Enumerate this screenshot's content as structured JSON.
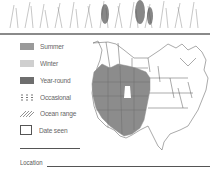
{
  "legend": {
    "items": [
      {
        "label": "Summer",
        "color": "#9a9a9a",
        "style": "solid"
      },
      {
        "label": "Winter",
        "color": "#cfcfcf",
        "style": "solid"
      },
      {
        "label": "Year-round",
        "color": "#6e6e6e",
        "style": "solid"
      },
      {
        "label": "Occasional",
        "color": "#777777",
        "style": "dashed"
      },
      {
        "label": "Ocean range",
        "color": "#777777",
        "style": "hatched"
      },
      {
        "label": "Date seen",
        "style": "box"
      }
    ]
  },
  "map": {
    "region": "North America",
    "range_color": "#8c8c8c"
  },
  "location": {
    "label": "Location"
  }
}
